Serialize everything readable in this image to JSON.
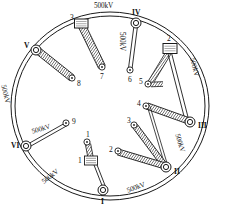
{
  "diagram": {
    "type": "ring-bus-single-line",
    "colors": {
      "line": "#1a1a1a",
      "fill": "#ffffff",
      "hatch": "#3a3a3a",
      "background": "#ffffff"
    },
    "ring": {
      "name": "outer-ring-bus",
      "cx": 110,
      "cy": 106,
      "rx": 98,
      "ry": 93,
      "double_line": true
    },
    "ring_nodes": [
      {
        "id": "I",
        "label": "I",
        "shape": "circle",
        "x": 103,
        "y": 190,
        "label_dx": -1,
        "label_dy": 10
      },
      {
        "id": "II",
        "label": "II",
        "shape": "circle",
        "x": 166,
        "y": 167,
        "label_dx": 8,
        "label_dy": 4
      },
      {
        "id": "III",
        "label": "III",
        "shape": "circle",
        "x": 190,
        "y": 122,
        "label_dx": 8,
        "label_dy": 3
      },
      {
        "id": "IV",
        "label": "IV",
        "shape": "circle",
        "x": 136,
        "y": 23,
        "label_dx": -2,
        "label_dy": -8
      },
      {
        "id": "V",
        "label": "V",
        "shape": "circle",
        "x": 36,
        "y": 50,
        "label_dx": -11,
        "label_dy": -3
      },
      {
        "id": "VI",
        "label": "VI",
        "shape": "circle",
        "x": 26,
        "y": 146,
        "label_dx": -13,
        "label_dy": 2
      },
      {
        "id": "2",
        "label": "2",
        "shape": "square",
        "x": 170,
        "y": 48,
        "label_dx": -1,
        "label_dy": -8
      },
      {
        "id": "3",
        "label": "3",
        "shape": "square",
        "x": 81,
        "y": 23,
        "label_dx": -8,
        "label_dy": -4
      }
    ],
    "terminal_nodes": [
      {
        "id": "t1",
        "label": "1",
        "x": 87,
        "y": 142,
        "label_dx": -1,
        "label_dy": -8
      },
      {
        "id": "t2",
        "label": "2",
        "x": 117,
        "y": 151,
        "label_dx": -8,
        "label_dy": -3
      },
      {
        "id": "t3",
        "label": "3",
        "x": 134,
        "y": 125,
        "label_dx": -7,
        "label_dy": -4
      },
      {
        "id": "t4",
        "label": "4",
        "x": 146,
        "y": 105,
        "label_dx": -8,
        "label_dy": -3
      },
      {
        "id": "t5",
        "label": "5",
        "x": 147,
        "y": 84,
        "label_dx": -8,
        "label_dy": -3
      },
      {
        "id": "t6",
        "label": "6",
        "x": 130,
        "y": 70,
        "label_dx": -1,
        "label_dy": 10
      },
      {
        "id": "t7",
        "label": "7",
        "x": 102,
        "y": 67,
        "label_dx": -1,
        "label_dy": 11
      },
      {
        "id": "t8",
        "label": "8",
        "x": 72,
        "y": 78,
        "label_dx": 5,
        "label_dy": 5
      },
      {
        "id": "t9",
        "label": "9",
        "x": 66,
        "y": 124,
        "label_dx": 6,
        "label_dy": 2
      }
    ],
    "transformer_box": {
      "id": "bay-1-box",
      "label": "1",
      "x": 90,
      "y": 160,
      "label_dx": -8,
      "label_dy": 1
    },
    "voltage_labels": [
      {
        "id": "kv-top",
        "text": "500kV",
        "x": 100,
        "y": 5,
        "rotate": 0
      },
      {
        "id": "kv-iv-to-6",
        "text": "500kV",
        "x": 135,
        "y": 33,
        "rotate": 90
      },
      {
        "id": "kv-right-upper",
        "text": "500kV",
        "x": 195,
        "y": 62,
        "rotate": 75
      },
      {
        "id": "kv-right-lower",
        "text": "500kV",
        "x": 183,
        "y": 138,
        "rotate": 72
      },
      {
        "id": "kv-bottom",
        "text": "500kV",
        "x": 130,
        "y": 186,
        "rotate": -22
      },
      {
        "id": "kv-bottom-left",
        "text": "500kV",
        "x": 44,
        "y": 177,
        "rotate": -40
      },
      {
        "id": "kv-left",
        "text": "500kV",
        "x": 8,
        "y": 87,
        "rotate": 75
      },
      {
        "id": "kv-vi-to-9",
        "text": "500kV",
        "x": 32,
        "y": 124,
        "rotate": -16
      }
    ],
    "connections": [
      {
        "from": "3",
        "to": "t7",
        "style": "hatched-thick"
      },
      {
        "from": "V",
        "to": "t8",
        "style": "hatched-thick"
      },
      {
        "from": "IV",
        "to": "t6",
        "style": "thin-double"
      },
      {
        "from": "VI",
        "to": "t9",
        "style": "thin-double"
      },
      {
        "from": "2",
        "to": "t5",
        "style": "hatched-thick"
      },
      {
        "from": "2",
        "to": "III",
        "style": "thin-double"
      },
      {
        "from": "III",
        "to": "t4",
        "style": "hatched-thick"
      },
      {
        "from": "II",
        "to": "t3",
        "style": "hatched-thick"
      },
      {
        "from": "II",
        "to": "t2",
        "style": "hatched-thick"
      },
      {
        "from": "II",
        "to": "t4",
        "style": "thin-double"
      },
      {
        "from": "t1",
        "to": "bay-1-box",
        "style": "hatched-thick"
      },
      {
        "from": "bay-1-box",
        "to": "I",
        "style": "thin-double"
      }
    ]
  }
}
